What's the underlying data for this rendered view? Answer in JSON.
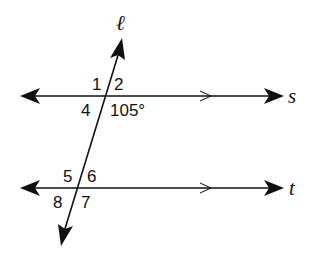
{
  "diagram": {
    "lines": {
      "transversal": "ℓ",
      "parallel_top": "s",
      "parallel_bottom": "t"
    },
    "angles_top": [
      "1",
      "2",
      "4",
      "105°"
    ],
    "angles_bottom": [
      "5",
      "6",
      "8",
      "7"
    ]
  }
}
